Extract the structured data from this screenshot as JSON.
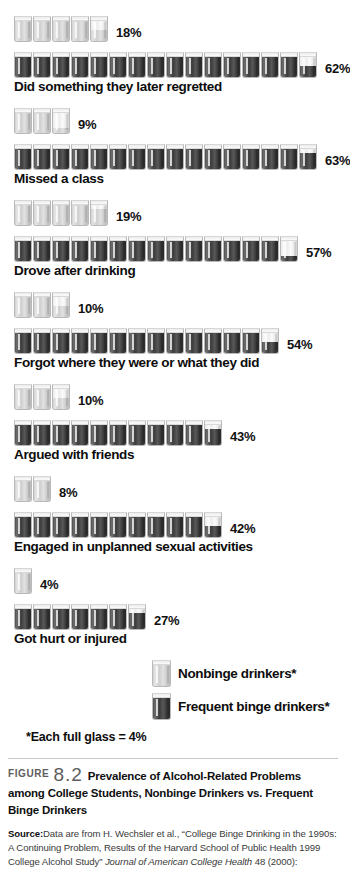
{
  "chart_data": {
    "type": "bar",
    "title": "Prevalence of Alcohol-Related Problems among College Students, Nonbinge Drinkers vs. Frequent Binge Drinkers",
    "xlabel": "",
    "ylabel": "",
    "unit_note": "*Each full glass = 4%",
    "categories": [
      "Did something they later regretted",
      "Missed a class",
      "Drove after drinking",
      "Forgot where they were or what they did",
      "Argued with friends",
      "Engaged in unplanned sexual activities",
      "Got hurt or injured"
    ],
    "series": [
      {
        "name": "Nonbinge drinkers*",
        "values": [
          18,
          9,
          19,
          10,
          10,
          8,
          4
        ],
        "labels": [
          "18%",
          "9%",
          "19%",
          "10%",
          "10%",
          "8%",
          "4%"
        ]
      },
      {
        "name": "Frequent binge drinkers*",
        "values": [
          62,
          63,
          57,
          54,
          43,
          42,
          27
        ],
        "labels": [
          "62%",
          "63%",
          "57%",
          "54%",
          "43%",
          "42%",
          "27%"
        ]
      }
    ]
  },
  "rows": [
    {
      "label": "Did something they later regretted",
      "nonbinge": {
        "value": 18,
        "label": "18%"
      },
      "binge": {
        "value": 62,
        "label": "62%"
      }
    },
    {
      "label": "Missed a class",
      "nonbinge": {
        "value": 9,
        "label": "9%"
      },
      "binge": {
        "value": 63,
        "label": "63%"
      }
    },
    {
      "label": "Drove after drinking",
      "nonbinge": {
        "value": 19,
        "label": "19%"
      },
      "binge": {
        "value": 57,
        "label": "57%"
      }
    },
    {
      "label": "Forgot where they were or what they did",
      "nonbinge": {
        "value": 10,
        "label": "10%"
      },
      "binge": {
        "value": 54,
        "label": "54%"
      }
    },
    {
      "label": "Argued with friends",
      "nonbinge": {
        "value": 10,
        "label": "10%"
      },
      "binge": {
        "value": 43,
        "label": "43%"
      }
    },
    {
      "label": "Engaged in unplanned sexual activities",
      "nonbinge": {
        "value": 8,
        "label": "8%"
      },
      "binge": {
        "value": 42,
        "label": "42%"
      }
    },
    {
      "label": "Got hurt or injured",
      "nonbinge": {
        "value": 4,
        "label": "4%"
      },
      "binge": {
        "value": 27,
        "label": "27%"
      }
    }
  ],
  "legend": {
    "items": [
      {
        "label": "Nonbinge drinkers*",
        "kind": "light"
      },
      {
        "label": "Frequent binge drinkers*",
        "kind": "dark"
      }
    ],
    "note": "*Each full glass = 4%"
  },
  "caption": {
    "figure_word": "FIGURE",
    "number": "8.2",
    "text": "Prevalence of Alcohol-Related Problems among College Students, Nonbinge Drinkers vs. Frequent Binge Drinkers"
  },
  "source": {
    "label": "Source:",
    "text_1": "Data are from H. Wechsler et al., “College Binge Drinking in the 1990s: A Continuing Problem, Results of the Harvard School of Public Health 1999 College Alcohol Study” ",
    "journal": "Journal of American College Health",
    "text_2": " 48 (2000):"
  },
  "glass_unit_percent": 4
}
